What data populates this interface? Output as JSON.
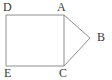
{
  "figure": {
    "background_color": "#ffffff",
    "stroke_color": "#8e8e8e",
    "label_color": "#3a3a3a",
    "stroke_width": 1,
    "labels": {
      "d": "D",
      "a": "A",
      "b": "B",
      "e": "E",
      "c": "C"
    },
    "vertices": [
      {
        "name": "D",
        "x": 6,
        "y": 15
      },
      {
        "name": "A",
        "x": 64,
        "y": 15
      },
      {
        "name": "B",
        "x": 90,
        "y": 38
      },
      {
        "name": "C",
        "x": 64,
        "y": 66
      },
      {
        "name": "E",
        "x": 6,
        "y": 66
      }
    ],
    "shapes": [
      {
        "name": "rectangle-DACE",
        "type": "polygon",
        "points": "6,15 64,15 64,66 6,66"
      },
      {
        "name": "triangle-ACB",
        "type": "polyline",
        "points": "64,15 90,38 64,66"
      }
    ]
  }
}
